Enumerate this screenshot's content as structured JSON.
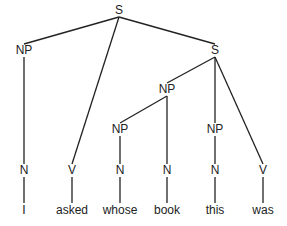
{
  "diagram": {
    "type": "syntax-tree",
    "nodes": [
      {
        "id": "s_root",
        "label": "S",
        "x": 119,
        "y": 10
      },
      {
        "id": "np_i",
        "label": "NP",
        "x": 24,
        "y": 50
      },
      {
        "id": "s_sub",
        "label": "S",
        "x": 215,
        "y": 50
      },
      {
        "id": "np_whose_book",
        "label": "NP",
        "x": 167,
        "y": 89
      },
      {
        "id": "np_whose",
        "label": "NP",
        "x": 120,
        "y": 129
      },
      {
        "id": "np_this",
        "label": "NP",
        "x": 215,
        "y": 129
      },
      {
        "id": "n_i",
        "label": "N",
        "x": 24,
        "y": 170
      },
      {
        "id": "v_asked",
        "label": "V",
        "x": 72,
        "y": 170
      },
      {
        "id": "n_whose",
        "label": "N",
        "x": 120,
        "y": 170
      },
      {
        "id": "n_book",
        "label": "N",
        "x": 167,
        "y": 170
      },
      {
        "id": "n_this",
        "label": "N",
        "x": 215,
        "y": 170
      },
      {
        "id": "v_was",
        "label": "V",
        "x": 263,
        "y": 170
      },
      {
        "id": "w_i",
        "label": "I",
        "x": 24,
        "y": 210
      },
      {
        "id": "w_asked",
        "label": "asked",
        "x": 72,
        "y": 210
      },
      {
        "id": "w_whose",
        "label": "whose",
        "x": 120,
        "y": 210
      },
      {
        "id": "w_book",
        "label": "book",
        "x": 167,
        "y": 210
      },
      {
        "id": "w_this",
        "label": "this",
        "x": 215,
        "y": 210
      },
      {
        "id": "w_was",
        "label": "was",
        "x": 263,
        "y": 210
      }
    ],
    "edges": [
      [
        "s_root",
        "np_i"
      ],
      [
        "s_root",
        "v_asked"
      ],
      [
        "s_root",
        "s_sub"
      ],
      [
        "np_i",
        "n_i"
      ],
      [
        "s_sub",
        "np_whose_book"
      ],
      [
        "s_sub",
        "np_this"
      ],
      [
        "s_sub",
        "v_was"
      ],
      [
        "np_whose_book",
        "np_whose"
      ],
      [
        "np_whose_book",
        "n_book"
      ],
      [
        "np_whose",
        "n_whose"
      ],
      [
        "np_this",
        "n_this"
      ],
      [
        "n_i",
        "w_i"
      ],
      [
        "v_asked",
        "w_asked"
      ],
      [
        "n_whose",
        "w_whose"
      ],
      [
        "n_book",
        "w_book"
      ],
      [
        "n_this",
        "w_this"
      ],
      [
        "v_was",
        "w_was"
      ]
    ],
    "sentence": "I asked whose book this was"
  }
}
